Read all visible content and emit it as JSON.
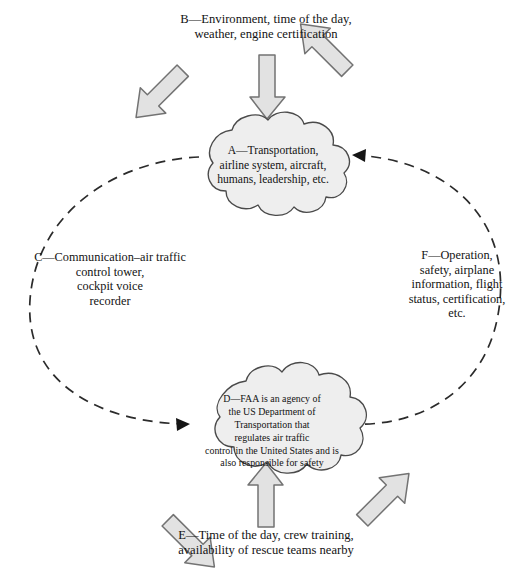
{
  "figure": {
    "type": "cycle-diagram"
  },
  "nodes": {
    "cloud_a": {
      "id": "A",
      "label": "A—Transportation,\nairline system, aircraft,\nhumans, leadership, etc.",
      "shape": "cloud"
    },
    "cloud_d": {
      "id": "D",
      "label": "D—FAA is an agency of\nthe US Department of\nTransportation that\nregulates air traffic\ncontrol in the United States and is\nalso responsible for safety",
      "shape": "cloud"
    }
  },
  "labels": {
    "b": {
      "id": "B",
      "text": "B—Environment, time of the day,\nweather, engine certification",
      "position": "top"
    },
    "c": {
      "id": "C",
      "text": "C—Communication–air traffic\ncontrol tower,\ncockpit voice\nrecorder",
      "position": "left"
    },
    "e": {
      "id": "E",
      "text": "E—Time of the day, crew training,\navailability of rescue teams nearby",
      "position": "bottom"
    },
    "f": {
      "id": "F",
      "text": "F—Operation,\nsafety, airplane\ninformation, flight\nstatus, certification,\netc.",
      "position": "right"
    }
  },
  "connectors": {
    "loop_left": {
      "name": "dashed-arc-a-to-d",
      "from": "A",
      "to": "D",
      "style": "dashed",
      "arrowhead": "at-d"
    },
    "loop_right": {
      "name": "dashed-arc-d-to-a",
      "from": "D",
      "to": "A",
      "style": "dashed",
      "arrowhead": "at-a"
    }
  },
  "block_arrows": {
    "top": [
      {
        "name": "top-left-block-arrow",
        "direction": "down-right"
      },
      {
        "name": "top-center-block-arrow",
        "direction": "down"
      },
      {
        "name": "top-right-block-arrow",
        "direction": "down-left"
      }
    ],
    "bottom": [
      {
        "name": "bottom-left-block-arrow",
        "direction": "up-right"
      },
      {
        "name": "bottom-center-block-arrow",
        "direction": "up"
      },
      {
        "name": "bottom-right-block-arrow",
        "direction": "up-left"
      }
    ]
  },
  "colors": {
    "background": "#ffffff",
    "cloud_fill": "#eeeeee",
    "cloud_stroke": "#4a4a4a",
    "arrow_fill": "#e2e2e2",
    "arrow_stroke": "#737373",
    "dash_stroke": "#2b2b2b",
    "text": "#131313"
  }
}
